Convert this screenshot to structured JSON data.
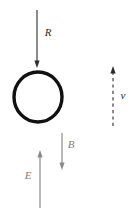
{
  "figure": {
    "kind": "physics-vector-diagram",
    "width": 135,
    "height": 219,
    "background_color": "#ffffff"
  },
  "loop": {
    "name": "conducting-loop",
    "shape": "ellipse",
    "center_x": 38,
    "center_y": 97,
    "radius_x": 24,
    "radius_y": 25,
    "stroke_color": "#111111",
    "stroke_width": 3.4,
    "fill": "none"
  },
  "vectors": [
    {
      "id": "R",
      "label": "R",
      "label_x": 48,
      "label_y": 33,
      "line_x": 37,
      "y_start": 10,
      "y_end": 68,
      "direction": "down",
      "style": "solid",
      "color": "#2b2b2b",
      "stroke_width": 1.1,
      "dim": false
    },
    {
      "id": "v",
      "label": "v",
      "label_x": 123,
      "label_y": 96,
      "line_x": 113,
      "y_start": 126,
      "y_end": 66,
      "direction": "up",
      "style": "dashed",
      "color": "#2b2b2b",
      "stroke_width": 1.1,
      "dim": false
    },
    {
      "id": "B",
      "label": "B",
      "label_x": 71,
      "label_y": 145,
      "line_x": 62,
      "y_start": 133,
      "y_end": 170,
      "direction": "down",
      "style": "solid",
      "color": "#8a8a8a",
      "stroke_width": 1.2,
      "dim": true
    },
    {
      "id": "E",
      "label": "E",
      "label_x": 28,
      "label_y": 176,
      "line_x": 40,
      "y_start": 208,
      "y_end": 150,
      "direction": "up",
      "style": "solid",
      "color": "#8a8a8a",
      "stroke_width": 1.2,
      "dim": true
    }
  ]
}
